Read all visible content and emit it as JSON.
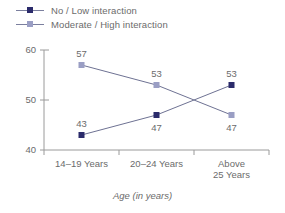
{
  "chart_data": {
    "type": "line",
    "title": "",
    "xlabel": "Age (in years)",
    "ylabel": "",
    "categories": [
      "14–19 Years",
      "20–24 Years",
      "Above\n25 Years"
    ],
    "category_lines": [
      [
        "14–19 Years"
      ],
      [
        "20–24 Years"
      ],
      [
        "Above",
        "25 Years"
      ]
    ],
    "series": [
      {
        "name": "No / Low interaction",
        "color": "#2b2b6b",
        "marker": "square",
        "values": [
          43,
          47,
          53
        ],
        "labels": [
          "43",
          "47",
          "53"
        ]
      },
      {
        "name": "Moderate / High interaction",
        "color": "#9a9ec4",
        "marker": "square",
        "values": [
          57,
          53,
          47
        ],
        "labels": [
          "57",
          "53",
          "47"
        ]
      }
    ],
    "ylim": [
      40,
      60
    ],
    "yticks": [
      40,
      50,
      60
    ],
    "ytick_labels": [
      "40",
      "50",
      "60"
    ],
    "grid": false,
    "legend_position": "top-left",
    "line_color": "#6e7293",
    "axis_color": "#9a9a9a"
  },
  "legend": {
    "items": [
      {
        "label": "No / Low interaction",
        "color": "#2b2b6b"
      },
      {
        "label": "Moderate / High interaction",
        "color": "#9a9ec4"
      }
    ]
  },
  "axes": {
    "x_title": "Age (in years)",
    "y_ticks": [
      "60",
      "50",
      "40"
    ],
    "x_ticks": [
      "14–19 Years",
      "20–24 Years",
      "Above",
      "25 Years"
    ]
  },
  "labels": {
    "s1_p1": "43",
    "s1_p2": "47",
    "s1_p3": "53",
    "s2_p1": "57",
    "s2_p2": "53",
    "s2_p3": "47"
  }
}
